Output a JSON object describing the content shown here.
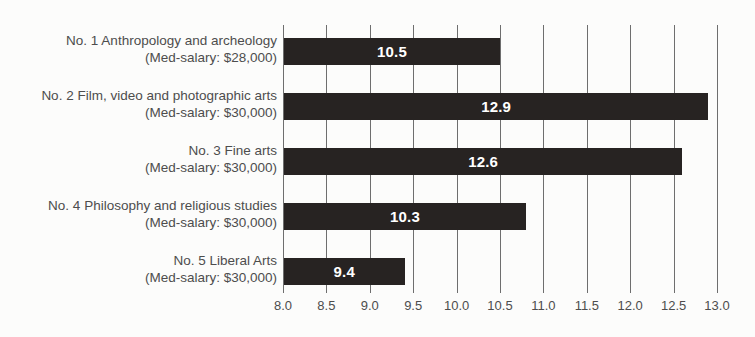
{
  "chart_data": {
    "type": "bar",
    "orientation": "horizontal",
    "categories": [
      {
        "name": "No. 1 Anthropology and archeology",
        "salary": "(Med-salary: $28,000)"
      },
      {
        "name": "No. 2 Film, video and photographic arts",
        "salary": "(Med-salary: $30,000)"
      },
      {
        "name": "No. 3 Fine arts",
        "salary": "(Med-salary: $30,000)"
      },
      {
        "name": "No. 4 Philosophy and religious studies",
        "salary": "(Med-salary: $30,000)"
      },
      {
        "name": "No. 5 Liberal Arts",
        "salary": "(Med-salary: $30,000)"
      }
    ],
    "values": [
      10.5,
      12.9,
      12.6,
      10.3,
      9.4
    ],
    "value_labels": [
      "10.5",
      "12.9",
      "12.6",
      "10.3",
      "9.4"
    ],
    "drawn_bar_extents": [
      10.5,
      12.9,
      12.6,
      10.8,
      9.4
    ],
    "xlim": [
      8.0,
      13.0
    ],
    "x_ticks": [
      "8.0",
      "8.5",
      "9.0",
      "9.5",
      "10.0",
      "10.5",
      "11.0",
      "11.5",
      "12.0",
      "12.5",
      "13.0"
    ],
    "grid": true,
    "legend": "none",
    "colors": {
      "bar": "#272322",
      "grid": "#6e6e6e",
      "text": "#4d4d4d",
      "value_text": "#ffffff",
      "background": "#fcfcfb"
    }
  }
}
